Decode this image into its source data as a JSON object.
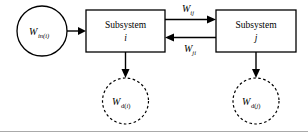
{
  "diagram": {
    "colors": {
      "stroke": "#000000",
      "background": "#ffffff",
      "frame": "#aaaaaa"
    },
    "input_node": {
      "shape": "circle-solid",
      "symbol": "W",
      "subscript": "in(i)"
    },
    "boxes": [
      {
        "name": "subsystem-i",
        "label": "Subsystem",
        "index": "i"
      },
      {
        "name": "subsystem-j",
        "label": "Subsystem",
        "index": "j"
      }
    ],
    "coupling_arrows": [
      {
        "name": "arrow-i-to-j",
        "direction": "right",
        "symbol": "W",
        "subscript": "ij"
      },
      {
        "name": "arrow-j-to-i",
        "direction": "left",
        "symbol": "W",
        "subscript": "ji"
      }
    ],
    "dissipation_nodes": [
      {
        "name": "dissipation-i",
        "shape": "circle-dashed",
        "symbol": "W",
        "subscript_upright": "d(",
        "subscript_italic": "i",
        "subscript_close": ")"
      },
      {
        "name": "dissipation-j",
        "shape": "circle-dashed",
        "symbol": "W",
        "subscript_upright": "d(",
        "subscript_italic": "j",
        "subscript_close": ")"
      }
    ]
  }
}
